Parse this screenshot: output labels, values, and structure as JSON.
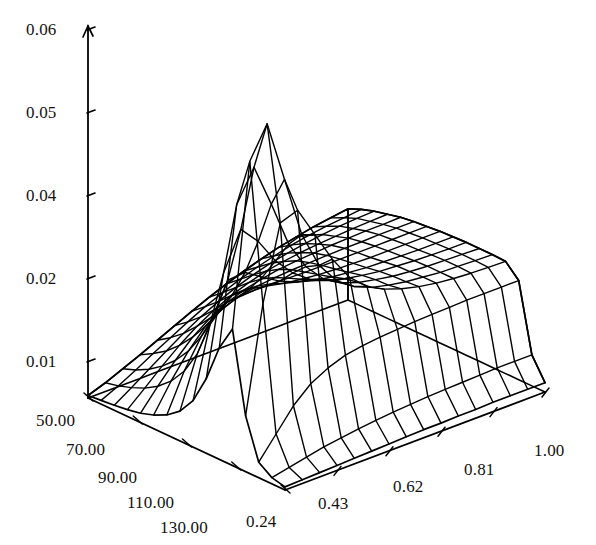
{
  "figure": {
    "kind": "3d-surface-wireframe",
    "background_color": "#ffffff",
    "line_color": "#000000",
    "title": "",
    "subtitle": ""
  },
  "chart_data": {
    "type": "surface",
    "title": "",
    "xlabel": "",
    "ylabel": "",
    "zlabel": "",
    "grid": true,
    "legend": false,
    "style": "wireframe",
    "projection": {
      "origin_px": [
        285,
        490
      ],
      "left_corner_px": [
        88,
        398
      ],
      "right_corner_px": [
        545,
        392
      ],
      "back_corner_px": [
        330,
        232
      ],
      "z_axis_top_px": [
        88,
        26
      ],
      "z_axis_base_px": [
        88,
        398
      ]
    },
    "z_axis": {
      "tick_labels": [
        "0.06",
        "0.05",
        "0.04",
        "0.02",
        "0.01"
      ],
      "tick_values": [
        0.06,
        0.05,
        0.04,
        0.02,
        0.01
      ],
      "tick_pixels_y": [
        30,
        113,
        196,
        279,
        362
      ],
      "zlim": [
        0,
        0.06
      ]
    },
    "y_axis": {
      "tick_labels": [
        "50.00",
        "70.00",
        "90.00",
        "110.00",
        "130.00"
      ],
      "tick_values": [
        50,
        70,
        90,
        110,
        130
      ],
      "ylim": [
        50,
        130
      ]
    },
    "x_axis": {
      "tick_labels": [
        "0.24",
        "0.43",
        "0.62",
        "0.81",
        "1.00"
      ],
      "tick_values": [
        0.24,
        0.43,
        0.62,
        0.81,
        1.0
      ],
      "xlim": [
        0.05,
        1.0
      ]
    },
    "features": {
      "peak_value": 0.053,
      "peak_at": {
        "x": 0.24,
        "y": 60
      },
      "plateau_value": 0.018,
      "plateau_at": {
        "x": 1.0,
        "y": 95
      },
      "floor_value": 0.0
    },
    "grid_size": {
      "nx": 16,
      "ny": 16
    },
    "surface_z": [
      [
        0.0005,
        0.0006,
        0.0007,
        0.0008,
        0.0009,
        0.001,
        0.0011,
        0.0012,
        0.0013,
        0.0013,
        0.0014,
        0.0014,
        0.0015,
        0.0015,
        0.0015,
        0.0015
      ],
      [
        0.001,
        0.0016,
        0.0022,
        0.0028,
        0.0032,
        0.0036,
        0.0039,
        0.0042,
        0.0044,
        0.0046,
        0.0047,
        0.0048,
        0.0049,
        0.005,
        0.005,
        0.005
      ],
      [
        0.0025,
        0.006,
        0.0095,
        0.012,
        0.0135,
        0.0145,
        0.015,
        0.0153,
        0.0155,
        0.0157,
        0.0158,
        0.0159,
        0.016,
        0.016,
        0.016,
        0.016
      ],
      [
        0.009,
        0.026,
        0.038,
        0.039,
        0.034,
        0.029,
        0.025,
        0.0225,
        0.021,
        0.02,
        0.0193,
        0.0188,
        0.0185,
        0.0183,
        0.0182,
        0.0181
      ],
      [
        0.022,
        0.048,
        0.053,
        0.043,
        0.033,
        0.027,
        0.0235,
        0.0215,
        0.0203,
        0.0196,
        0.0191,
        0.0188,
        0.0185,
        0.0184,
        0.0183,
        0.0182
      ],
      [
        0.018,
        0.04,
        0.045,
        0.038,
        0.0305,
        0.0258,
        0.0228,
        0.0211,
        0.0201,
        0.0195,
        0.019,
        0.0187,
        0.0185,
        0.0184,
        0.0183,
        0.0182
      ],
      [
        0.012,
        0.028,
        0.034,
        0.031,
        0.0268,
        0.0238,
        0.0217,
        0.0205,
        0.0197,
        0.0192,
        0.0188,
        0.0186,
        0.0184,
        0.0183,
        0.0182,
        0.0182
      ],
      [
        0.0075,
        0.019,
        0.0248,
        0.025,
        0.0232,
        0.0215,
        0.0203,
        0.0195,
        0.019,
        0.0187,
        0.0184,
        0.0183,
        0.0182,
        0.0181,
        0.0181,
        0.0181
      ],
      [
        0.0048,
        0.013,
        0.0183,
        0.0203,
        0.0203,
        0.0197,
        0.0191,
        0.0187,
        0.0184,
        0.0182,
        0.0181,
        0.018,
        0.018,
        0.018,
        0.018,
        0.018
      ],
      [
        0.0032,
        0.0092,
        0.0138,
        0.0166,
        0.0178,
        0.018,
        0.018,
        0.0179,
        0.0178,
        0.0178,
        0.0178,
        0.0178,
        0.0178,
        0.0178,
        0.0178,
        0.0178
      ],
      [
        0.0022,
        0.0066,
        0.0104,
        0.0134,
        0.0152,
        0.0162,
        0.0167,
        0.017,
        0.0172,
        0.0173,
        0.0174,
        0.0175,
        0.0175,
        0.0176,
        0.0176,
        0.0176
      ],
      [
        0.0015,
        0.0048,
        0.0079,
        0.0106,
        0.0126,
        0.0141,
        0.0151,
        0.0158,
        0.0163,
        0.0166,
        0.0168,
        0.017,
        0.0171,
        0.0172,
        0.0172,
        0.0173
      ],
      [
        0.0011,
        0.0035,
        0.006,
        0.0083,
        0.0103,
        0.0119,
        0.0132,
        0.0142,
        0.015,
        0.0155,
        0.0159,
        0.0162,
        0.0164,
        0.0166,
        0.0167,
        0.0168
      ],
      [
        0.0008,
        0.0026,
        0.0045,
        0.0064,
        0.0082,
        0.0098,
        0.0112,
        0.0124,
        0.0134,
        0.0142,
        0.0148,
        0.0153,
        0.0157,
        0.016,
        0.0162,
        0.0163
      ],
      [
        0.0006,
        0.0019,
        0.0034,
        0.005,
        0.0065,
        0.008,
        0.0094,
        0.0106,
        0.0117,
        0.0126,
        0.0134,
        0.0141,
        0.0146,
        0.015,
        0.0153,
        0.0156
      ],
      [
        0.0004,
        0.0014,
        0.0026,
        0.0038,
        0.0051,
        0.0064,
        0.0077,
        0.0089,
        0.01,
        0.011,
        0.0119,
        0.0127,
        0.0133,
        0.0139,
        0.0143,
        0.0147
      ]
    ]
  },
  "labels": {
    "z": [
      {
        "text": "0.06",
        "x": 26,
        "y": 20
      },
      {
        "text": "0.05",
        "x": 26,
        "y": 103
      },
      {
        "text": "0.04",
        "x": 26,
        "y": 186
      },
      {
        "text": "0.02",
        "x": 26,
        "y": 269
      },
      {
        "text": "0.01",
        "x": 26,
        "y": 352
      }
    ],
    "y": [
      {
        "text": "50.00",
        "x": 36,
        "y": 411
      },
      {
        "text": "70.00",
        "x": 66,
        "y": 440
      },
      {
        "text": "90.00",
        "x": 98,
        "y": 468
      },
      {
        "text": "110.00",
        "x": 127,
        "y": 493
      },
      {
        "text": "130.00",
        "x": 160,
        "y": 518
      }
    ],
    "x": [
      {
        "text": "0.24",
        "x": 246,
        "y": 512
      },
      {
        "text": "0.43",
        "x": 318,
        "y": 494
      },
      {
        "text": "0.62",
        "x": 393,
        "y": 477
      },
      {
        "text": "0.81",
        "x": 464,
        "y": 460
      },
      {
        "text": "1.00",
        "x": 534,
        "y": 441
      }
    ]
  }
}
